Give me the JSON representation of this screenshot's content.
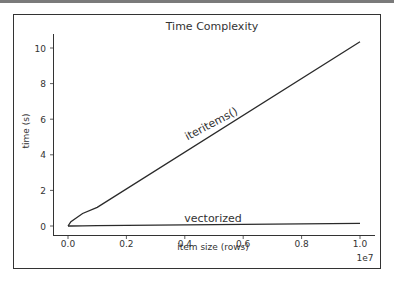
{
  "chart_data": {
    "type": "line",
    "title": "Time Complexity",
    "xlabel": "item size (rows)",
    "ylabel": "time (s)",
    "x_offset_label": "1e7",
    "xlim": [
      -0.05,
      1.05
    ],
    "ylim": [
      -0.5,
      10.8
    ],
    "x_ticks": [
      "0.0",
      "0.2",
      "0.4",
      "0.6",
      "0.8",
      "1.0"
    ],
    "y_ticks": [
      "0",
      "2",
      "4",
      "6",
      "8",
      "10"
    ],
    "x": [
      0.0,
      0.01,
      0.05,
      0.1,
      1.0
    ],
    "series": [
      {
        "name": "iteritems()",
        "values": [
          0.0,
          0.25,
          0.7,
          1.05,
          10.35
        ]
      },
      {
        "name": "vectorized",
        "values": [
          0.0,
          0.0,
          0.01,
          0.02,
          0.15
        ]
      }
    ],
    "annotations": [
      "iteritems()",
      "vectorized"
    ],
    "grid": false,
    "legend": "none (inline labels)"
  }
}
